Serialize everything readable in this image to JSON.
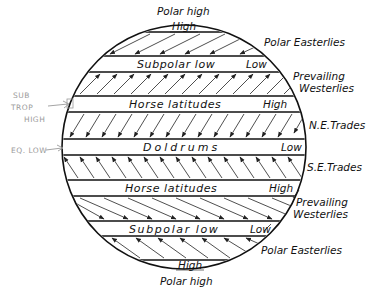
{
  "circle": {
    "cx": 184,
    "cy": 147,
    "r": 122,
    "stroke": "#111111"
  },
  "top_label": "Polar high",
  "bottom_label": "Polar high",
  "zones": [
    {
      "id": "north-polar-high",
      "name": "",
      "tag": "High",
      "y_top": 24,
      "y_bottom": 32
    },
    {
      "id": "north-subpolar-low",
      "name": "Subpolar low",
      "tag": "Low",
      "y_top": 56,
      "y_bottom": 72
    },
    {
      "id": "north-horse-latitudes",
      "name": "Horse latitudes",
      "tag": "High",
      "y_top": 96,
      "y_bottom": 112
    },
    {
      "id": "doldrums",
      "name": "Doldrums",
      "tag": "Low",
      "y_top": 139,
      "y_bottom": 155
    },
    {
      "id": "south-horse-latitudes",
      "name": "Horse latitudes",
      "tag": "High",
      "y_top": 180,
      "y_bottom": 196
    },
    {
      "id": "south-subpolar-low",
      "name": "Subpolar low",
      "tag": "Low",
      "y_top": 221,
      "y_bottom": 236
    },
    {
      "id": "south-polar-high",
      "name": "",
      "tag": "High",
      "y_top": 260,
      "y_bottom": 269
    }
  ],
  "wind_belts": [
    {
      "id": "north-polar-easterlies",
      "label": "Polar Easterlies",
      "direction": "down-left",
      "label_x": 262,
      "label_y": 47
    },
    {
      "id": "north-prevailing-westerlies",
      "label_lines": [
        "Prevailing",
        "Westerlies"
      ],
      "direction": "up-right",
      "label_x": 293,
      "label_y": 79
    },
    {
      "id": "ne-trades",
      "label": "N.E.Trades",
      "direction": "down-left",
      "label_x": 309,
      "label_y": 129
    },
    {
      "id": "se-trades",
      "label": "S.E.Trades",
      "direction": "up-left",
      "label_x": 307,
      "label_y": 171
    },
    {
      "id": "south-prevailing-westerlies",
      "label_lines": [
        "Prevailing",
        "Westerlies"
      ],
      "direction": "down-right",
      "label_x": 297,
      "label_y": 206
    },
    {
      "id": "south-polar-easterlies",
      "label": "Polar Easterlies",
      "direction": "up-left",
      "label_x": 261,
      "label_y": 254
    }
  ],
  "handwritten_notes": {
    "sub_trop_high": [
      "SUB",
      "TROP",
      "HIGH"
    ],
    "eq_low": "EQ. LOW",
    "color": "#9a9a9a"
  }
}
